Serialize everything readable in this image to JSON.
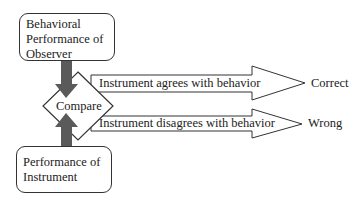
{
  "diagram": {
    "observer_box": {
      "line1": "Behavioral",
      "line2": "Performance of",
      "line3": "Observer"
    },
    "instrument_box": {
      "line1": "Performance of",
      "line2": "Instrument"
    },
    "compare_node": {
      "label": "Compare"
    },
    "agree_arrow": {
      "label": "Instrument agrees with behavior",
      "outcome": "Correct"
    },
    "disagree_arrow": {
      "label": "Instrument disagrees with behavior",
      "outcome": "Wrong"
    },
    "colors": {
      "stroke": "#333333",
      "flow_arrow": "#555555",
      "background": "#ffffff"
    }
  }
}
